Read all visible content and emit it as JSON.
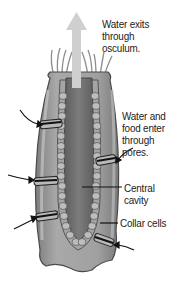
{
  "diagram": {
    "labels": {
      "osculum": "Water exits\nthrough\nosculum.",
      "pores": "Water and\nfood enter\nthrough\npores.",
      "central_cavity": "Central\ncavity",
      "collar_cells": "Collar cells"
    },
    "colors": {
      "outer_body": "#8a8a8a",
      "outer_highlight": "#b5b5b5",
      "inner_wall": "#a3a3a3",
      "cavity": "#6e6e6e",
      "arrow_fill": "#c9c9c9",
      "pore_band": "#2a2a2a",
      "leader_line": "#111111",
      "text": "#222222"
    }
  }
}
